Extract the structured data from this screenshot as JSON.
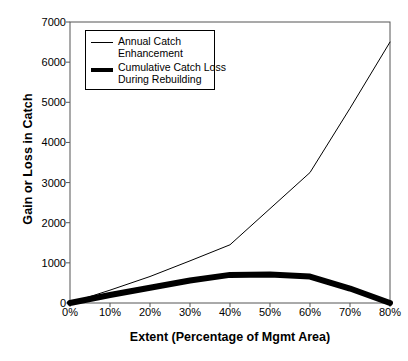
{
  "chart_data": {
    "type": "line",
    "title": "",
    "xlabel": "Extent (Percentage of Mgmt Area)",
    "ylabel": "Gain or Loss in Catch",
    "x": [
      0,
      10,
      20,
      30,
      40,
      50,
      60,
      70,
      80
    ],
    "xtick_labels": [
      "0%",
      "10%",
      "20%",
      "30%",
      "40%",
      "50%",
      "60%",
      "70%",
      "80%"
    ],
    "ytick_labels": [
      "0",
      "1000",
      "2000",
      "3000",
      "4000",
      "5000",
      "6000",
      "7000"
    ],
    "ytick_values": [
      0,
      1000,
      2000,
      3000,
      4000,
      5000,
      6000,
      7000
    ],
    "xlim": [
      0,
      80
    ],
    "ylim": [
      0,
      7000
    ],
    "grid": false,
    "legend_position": "upper-left",
    "series": [
      {
        "name": "Annual Catch Enhancement",
        "style": "thin",
        "color": "#000000",
        "width": 1,
        "x": [
          0,
          10,
          20,
          30,
          40,
          50,
          60,
          70,
          80
        ],
        "values": [
          0,
          320,
          660,
          1050,
          1450,
          2350,
          3250,
          4850,
          6500
        ]
      },
      {
        "name": "Cumulative Catch Loss During Rebuilding",
        "style": "thick",
        "color": "#000000",
        "width": 6,
        "x": [
          0,
          10,
          20,
          30,
          40,
          50,
          60,
          70,
          80
        ],
        "values": [
          0,
          200,
          380,
          560,
          700,
          710,
          660,
          360,
          0
        ]
      }
    ]
  },
  "legend": {
    "items": [
      {
        "label_line1": "Annual Catch",
        "label_line2": "Enhancement",
        "swatch": "thin-line-swatch"
      },
      {
        "label_line1": "Cumulative Catch Loss",
        "label_line2": "During Rebuilding",
        "swatch": "thick-line-swatch"
      }
    ]
  },
  "caption": ""
}
